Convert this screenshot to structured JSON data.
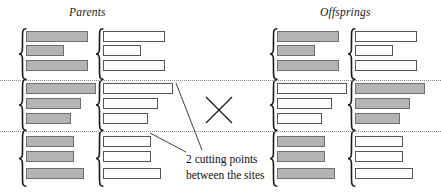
{
  "figure": {
    "type": "two-point-crossover-diagram",
    "width": 441,
    "height": 193,
    "background": "#ffffff"
  },
  "headings": {
    "parents": "Parents",
    "offsprings": "Offsprings"
  },
  "caption": {
    "line1": "2 cutting points",
    "line2": "between the sites"
  },
  "colors": {
    "gray_gene": "#b4b4b4",
    "white_gene": "#ffffff",
    "gene_border": "#5a5a5a",
    "cut_line": "#8c8c8c",
    "bracket": "#1a1a1a",
    "text": "#111111"
  },
  "cut_lines": [
    {
      "name": "cut-point-1",
      "y": 80
    },
    {
      "name": "cut-point-2",
      "y": 131
    }
  ],
  "segments": [
    {
      "name": "segment-top",
      "genes": 3,
      "y_start": 30,
      "y_end": 79
    },
    {
      "name": "segment-middle",
      "genes": 3,
      "y_start": 81,
      "y_end": 130
    },
    {
      "name": "segment-bottom",
      "genes": 3,
      "y_start": 132,
      "y_end": 186
    }
  ],
  "gene_widths": [
    62,
    38,
    62,
    70,
    55,
    45,
    48,
    48,
    58
  ],
  "gene_y": [
    31,
    45,
    60,
    83,
    98,
    113,
    136,
    151,
    168
  ],
  "chromosomes": [
    {
      "name": "parent-1",
      "role": "parent",
      "x": 26,
      "bracket_x": 18,
      "genes": [
        {
          "width": 62,
          "fill": "gray"
        },
        {
          "width": 38,
          "fill": "gray"
        },
        {
          "width": 62,
          "fill": "gray"
        },
        {
          "width": 70,
          "fill": "gray"
        },
        {
          "width": 55,
          "fill": "gray"
        },
        {
          "width": 45,
          "fill": "gray"
        },
        {
          "width": 48,
          "fill": "gray"
        },
        {
          "width": 48,
          "fill": "gray"
        },
        {
          "width": 58,
          "fill": "gray"
        }
      ]
    },
    {
      "name": "parent-2",
      "role": "parent",
      "x": 103,
      "bracket_x": 95,
      "genes": [
        {
          "width": 62,
          "fill": "white"
        },
        {
          "width": 38,
          "fill": "white"
        },
        {
          "width": 62,
          "fill": "white"
        },
        {
          "width": 70,
          "fill": "white"
        },
        {
          "width": 55,
          "fill": "white"
        },
        {
          "width": 45,
          "fill": "white"
        },
        {
          "width": 48,
          "fill": "white"
        },
        {
          "width": 48,
          "fill": "white"
        },
        {
          "width": 58,
          "fill": "white"
        }
      ]
    },
    {
      "name": "offspring-1",
      "role": "offspring",
      "x": 277,
      "bracket_x": 269,
      "genes": [
        {
          "width": 62,
          "fill": "gray"
        },
        {
          "width": 38,
          "fill": "gray"
        },
        {
          "width": 62,
          "fill": "gray"
        },
        {
          "width": 70,
          "fill": "white"
        },
        {
          "width": 55,
          "fill": "white"
        },
        {
          "width": 45,
          "fill": "white"
        },
        {
          "width": 48,
          "fill": "gray"
        },
        {
          "width": 48,
          "fill": "gray"
        },
        {
          "width": 58,
          "fill": "gray"
        }
      ]
    },
    {
      "name": "offspring-2",
      "role": "offspring",
      "x": 355,
      "bracket_x": 347,
      "genes": [
        {
          "width": 62,
          "fill": "white"
        },
        {
          "width": 38,
          "fill": "white"
        },
        {
          "width": 62,
          "fill": "white"
        },
        {
          "width": 70,
          "fill": "gray"
        },
        {
          "width": 55,
          "fill": "gray"
        },
        {
          "width": 45,
          "fill": "gray"
        },
        {
          "width": 48,
          "fill": "white"
        },
        {
          "width": 48,
          "fill": "white"
        },
        {
          "width": 58,
          "fill": "white"
        }
      ]
    }
  ],
  "crossover_mark": {
    "name": "crossover-x",
    "x": 205,
    "y": 96,
    "size": 28
  },
  "leader_lines": [
    {
      "name": "leader-to-cut-point-1",
      "x1": 202,
      "y1": 150,
      "x2": 176,
      "y2": 83
    },
    {
      "name": "leader-to-cut-point-2",
      "x1": 186,
      "y1": 152,
      "x2": 150,
      "y2": 133
    }
  ]
}
